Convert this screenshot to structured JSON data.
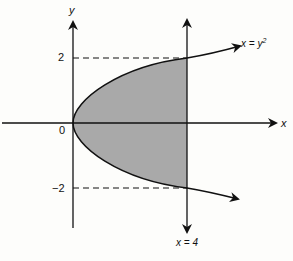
{
  "diagram": {
    "axes": {
      "x_label": "x",
      "y_label": "y",
      "origin_label": "0"
    },
    "ticks": {
      "y_pos": "2",
      "y_neg": "−2"
    },
    "curve_label": "x = y²",
    "curve_label_base": "x = y",
    "curve_label_exp": "2",
    "line_label": "x = 4",
    "shaded_region": "region bounded by x = y² and x = 4",
    "colors": {
      "shade": "#a9a9a9",
      "stroke": "#111111"
    }
  }
}
